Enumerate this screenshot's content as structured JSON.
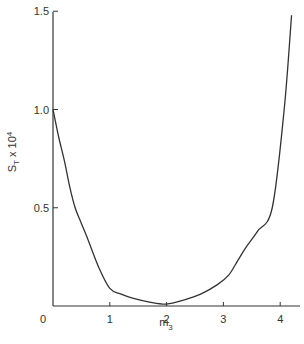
{
  "chart_data": {
    "type": "line",
    "title": "",
    "xlabel": "m3",
    "ylabel": "S_T x 10^4",
    "xlabel_parts": {
      "base": "m",
      "sub": "3"
    },
    "ylabel_parts": {
      "base": "S",
      "sub": "T",
      "mid": " x 10",
      "sup": "4"
    },
    "xlim": [
      0,
      4.3
    ],
    "ylim": [
      0,
      1.5
    ],
    "x_ticks": [
      "0",
      "1",
      "2",
      "3",
      "4"
    ],
    "y_ticks": [
      "0.5",
      "1.0",
      "1.5"
    ],
    "grid": false,
    "legend": null,
    "series": [
      {
        "name": "S_T",
        "x": [
          0.0,
          0.1,
          0.2,
          0.3,
          0.39,
          0.5,
          0.6,
          0.8,
          1.0,
          1.2,
          1.4,
          1.7,
          2.0,
          2.3,
          2.6,
          2.9,
          3.1,
          3.25,
          3.4,
          3.6,
          3.86,
          4.07,
          4.2
        ],
        "values": [
          1.0,
          0.86,
          0.74,
          0.6,
          0.5,
          0.42,
          0.35,
          0.2,
          0.09,
          0.06,
          0.04,
          0.02,
          0.01,
          0.03,
          0.06,
          0.11,
          0.16,
          0.23,
          0.3,
          0.38,
          0.5,
          1.0,
          1.48
        ]
      }
    ]
  },
  "axes": {
    "origin_label": "0"
  }
}
